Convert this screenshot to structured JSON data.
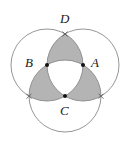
{
  "diagram": {
    "type": "geometry",
    "colors": {
      "stroke": "#8a8a8a",
      "shade": "#b4b4b4",
      "point": "#111111",
      "background": "#ffffff"
    },
    "radius": 36,
    "points": {
      "A": {
        "label": "A",
        "x": 83,
        "y": 65
      },
      "B": {
        "label": "B",
        "x": 47,
        "y": 65
      },
      "C": {
        "label": "C",
        "x": 65,
        "y": 96
      },
      "D": {
        "label": "D",
        "x": 65,
        "y": 34
      }
    },
    "labels": {
      "A": "A",
      "B": "B",
      "C": "C",
      "D": "D"
    }
  }
}
